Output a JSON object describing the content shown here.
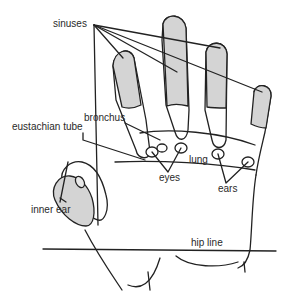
{
  "diagram": {
    "colors": {
      "shaded": "#d4d4d4",
      "line": "#222222",
      "background": "#ffffff"
    },
    "labels": {
      "sinuses": "sinuses",
      "bronchus": "bronchus",
      "eustachian_tube": "eustachian tube",
      "lung": "lung",
      "eyes": "eyes",
      "ears": "ears",
      "inner_ear": "inner ear",
      "hip_line": "hip line"
    }
  }
}
